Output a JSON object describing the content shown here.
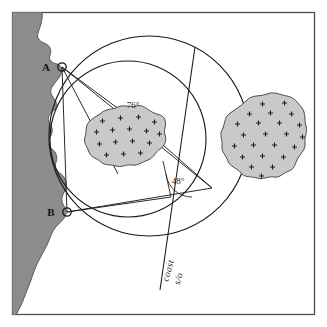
{
  "figure": {
    "background_color": "#ffffff",
    "frame": {
      "name": "chart-border",
      "color": "#4f4f4f",
      "x": 12,
      "y": 12,
      "width": 303,
      "height": 303
    }
  },
  "colors": {
    "land_fill": "#8d8d8d",
    "land_stroke": "#585858",
    "shoal_fill": "#c9c9c9",
    "shoal_stroke": "#4a4a4a",
    "line": "#1f1f1f",
    "circle": "#1a1a1a",
    "text": "#141414"
  },
  "stations": [
    {
      "id": "A",
      "label": "A",
      "x": 62,
      "y": 67,
      "marker": "open-circle"
    },
    {
      "id": "B",
      "label": "B",
      "x": 67,
      "y": 212,
      "marker": "open-circle"
    }
  ],
  "angles": [
    {
      "id": "angle-76",
      "label": "76°",
      "value": 76,
      "unit": "degrees",
      "x": 133,
      "y": 108,
      "vertex_x": 139,
      "vertex_y": 124
    },
    {
      "id": "angle-48",
      "label": "48°",
      "value": 48,
      "unit": "degrees",
      "x": 178,
      "y": 184,
      "vertex_x": 171,
      "vertex_y": 197
    }
  ],
  "position_circles": [
    {
      "id": "circle-A",
      "name": "position-circle-76",
      "cx": 149,
      "cy": 136,
      "r": 100,
      "through": [
        "A",
        "B"
      ],
      "angle_label": "76°"
    },
    {
      "id": "circle-B",
      "name": "position-circle-48",
      "cx": 128,
      "cy": 139,
      "r": 78,
      "through": [
        "A",
        "B"
      ],
      "angle_label": "48°"
    }
  ],
  "coast_line_label": {
    "name": "coast-line-annotation",
    "line_1": "coast",
    "line_2": "s/o",
    "rotation_deg": -74
  },
  "shoals": [
    {
      "id": "shoal-left",
      "name": "shoal-area-left",
      "cx": 125,
      "cy": 139,
      "symbol": "+"
    },
    {
      "id": "shoal-right",
      "name": "shoal-area-right",
      "cx": 265,
      "cy": 135,
      "symbol": "+"
    }
  ],
  "legend_notes": {
    "land": "land / coastline (shaded)",
    "shoal": "shoal or sandbank (cross hatching)",
    "fix": "observer position at intersection of position circles"
  }
}
